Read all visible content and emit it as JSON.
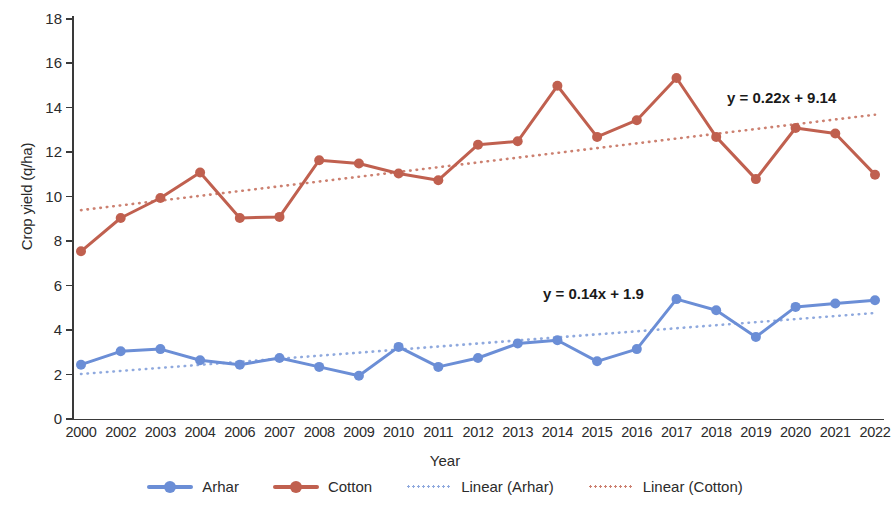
{
  "chart_data": {
    "type": "line",
    "title": "",
    "xlabel": "Year",
    "ylabel": "Crop yield (q/ha)",
    "ylim": [
      0,
      18
    ],
    "ytick_step": 2,
    "yticks": [
      0,
      2,
      4,
      6,
      8,
      10,
      12,
      14,
      16,
      18
    ],
    "grid": false,
    "legend_position": "bottom",
    "categories": [
      "2000",
      "2002",
      "2003",
      "2004",
      "2006",
      "2007",
      "2008",
      "2009",
      "2010",
      "2011",
      "2012",
      "2013",
      "2014",
      "2015",
      "2016",
      "2017",
      "2018",
      "2019",
      "2020",
      "2021",
      "2022"
    ],
    "series": [
      {
        "name": "Arhar",
        "color": "#6b8ed6",
        "style": "solid-marker",
        "values": [
          2.4,
          3.0,
          3.1,
          2.6,
          2.4,
          2.7,
          2.3,
          1.9,
          3.2,
          2.3,
          2.7,
          3.35,
          3.5,
          2.55,
          3.1,
          5.35,
          4.85,
          3.65,
          5.0,
          5.15,
          5.3
        ]
      },
      {
        "name": "Cotton",
        "color": "#c0604f",
        "style": "solid-marker",
        "values": [
          7.5,
          9.0,
          9.9,
          11.05,
          9.0,
          9.05,
          11.6,
          11.45,
          11.0,
          10.7,
          12.3,
          12.45,
          14.95,
          12.65,
          13.4,
          15.3,
          12.65,
          10.75,
          13.05,
          12.8,
          10.95
        ]
      },
      {
        "name": "Linear (Arhar)",
        "color": "#8fa9de",
        "style": "dotted",
        "trendline_for": "Arhar",
        "equation": "y = 0.14x + 1.9",
        "slope": 0.14,
        "intercept": 1.9
      },
      {
        "name": "Linear (Cotton)",
        "color": "#cc8070",
        "style": "dotted",
        "trendline_for": "Cotton",
        "equation": "y = 0.22x + 9.14",
        "slope": 0.22,
        "intercept": 9.14
      }
    ],
    "annotations": [
      {
        "text": "y = 0.22x + 9.14",
        "target": "Linear (Cotton)"
      },
      {
        "text": "y = 0.14x + 1.9",
        "target": "Linear (Arhar)"
      }
    ]
  },
  "legend": {
    "items": [
      {
        "label": "Arhar",
        "color": "#6b8ed6",
        "style": "solid-marker"
      },
      {
        "label": "Cotton",
        "color": "#c0604f",
        "style": "solid-marker"
      },
      {
        "label": "Linear (Arhar)",
        "color": "#8fa9de",
        "style": "dotted"
      },
      {
        "label": "Linear (Cotton)",
        "color": "#cc8070",
        "style": "dotted"
      }
    ]
  }
}
